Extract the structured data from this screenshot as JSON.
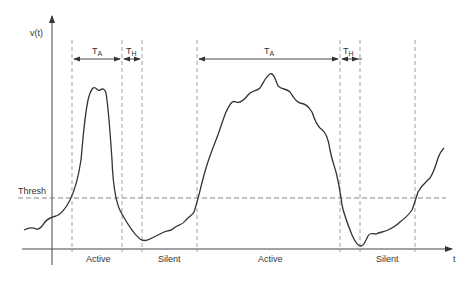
{
  "diagram": {
    "y_axis_label": "v(t)",
    "x_axis_label": "t",
    "threshold_label": "Thresh",
    "intervals": [
      {
        "symbol": "T",
        "subscript": "A"
      },
      {
        "symbol": "T",
        "subscript": "H"
      },
      {
        "symbol": "T",
        "subscript": "A"
      },
      {
        "symbol": "T",
        "subscript": "H"
      }
    ],
    "regions": [
      "Active",
      "Silent",
      "Active",
      "Silent"
    ]
  }
}
